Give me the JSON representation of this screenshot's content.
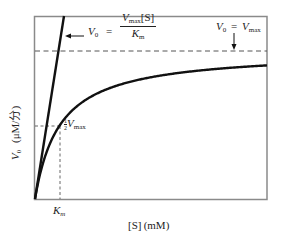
{
  "figure": {
    "x_axis_label": "[S] (mM)",
    "y_axis_label_var": "V",
    "y_axis_label_sub": "0",
    "y_axis_label_units": "(μM/分)",
    "km_label_main": "K",
    "km_label_sub": "m",
    "half_vmax": {
      "num": "1",
      "den": "2",
      "var": "V",
      "sub": "max"
    },
    "initial_slope_eq": {
      "lhs_var": "V",
      "lhs_sub": "0",
      "equals": "=",
      "num_var": "V",
      "num_sub": "max",
      "num_rest": "[S]",
      "den_var": "K",
      "den_sub": "m"
    },
    "vmax_eq": {
      "lhs_var": "V",
      "lhs_sub": "0",
      "equals": "=",
      "rhs_var": "V",
      "rhs_sub": "max"
    }
  },
  "chart_data": {
    "type": "line",
    "title": "",
    "xlabel": "[S] (mM)",
    "ylabel": "V0 (μM/分)",
    "grid": false,
    "legend": "none",
    "axis_ticks": "none (schematic)",
    "series": [
      {
        "name": "Michaelis-Menten curve V0 = Vmax[S]/(Km+[S])",
        "style": "solid thick",
        "Km": 1,
        "Vmax": 1,
        "x": [
          0,
          0.25,
          0.5,
          1,
          2,
          3,
          4,
          6,
          8,
          10
        ],
        "values": [
          0,
          0.2,
          0.333,
          0.5,
          0.667,
          0.75,
          0.8,
          0.857,
          0.889,
          0.909
        ]
      },
      {
        "name": "Initial slope asymptote V0 = Vmax[S]/Km",
        "style": "solid thick",
        "x": [
          0,
          1.25
        ],
        "values": [
          0,
          1.25
        ]
      },
      {
        "name": "Vmax asymptote",
        "style": "dashed",
        "x": [
          0,
          10
        ],
        "values": [
          1,
          1
        ]
      },
      {
        "name": "1/2 Vmax guide",
        "style": "dashed",
        "x": [
          0,
          1
        ],
        "values": [
          0.5,
          0.5
        ]
      },
      {
        "name": "Km guide",
        "style": "dashed",
        "x": [
          1,
          1
        ],
        "values": [
          0,
          0.5
        ]
      }
    ],
    "annotations": [
      "V0 = Vmax[S]/Km",
      "V0 = Vmax",
      "1/2 Vmax",
      "Km"
    ],
    "colors": {
      "line": "#111111",
      "frame": "#888888",
      "dashed": "#555555"
    }
  }
}
